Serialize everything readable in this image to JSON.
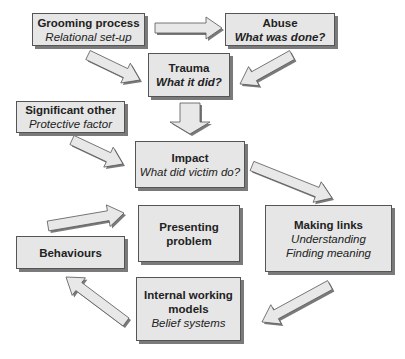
{
  "diagram": {
    "nodes": [
      {
        "id": "grooming",
        "title": "Grooming process",
        "subtitle": "Relational set-up"
      },
      {
        "id": "abuse",
        "title": "Abuse",
        "subtitle": "What was done?"
      },
      {
        "id": "trauma",
        "title": "Trauma",
        "subtitle": "What it did?"
      },
      {
        "id": "significant_other",
        "title": "Significant other",
        "subtitle": "Protective factor"
      },
      {
        "id": "impact",
        "title": "Impact",
        "subtitle": "What did victim do?"
      },
      {
        "id": "presenting",
        "title_line1": "Presenting",
        "title_line2": "problem"
      },
      {
        "id": "making_links",
        "title": "Making links",
        "subtitle_line1": "Understanding",
        "subtitle_line2": "Finding meaning"
      },
      {
        "id": "behaviours",
        "title": "Behaviours"
      },
      {
        "id": "iwm",
        "title_line1": "Internal working",
        "title_line2": "models",
        "subtitle": "Belief systems"
      }
    ],
    "edges": [
      {
        "from": "grooming",
        "to": "abuse"
      },
      {
        "from": "grooming",
        "to": "trauma"
      },
      {
        "from": "abuse",
        "to": "trauma"
      },
      {
        "from": "trauma",
        "to": "impact"
      },
      {
        "from": "significant_other",
        "to": "impact"
      },
      {
        "from": "impact",
        "to": "making_links"
      },
      {
        "from": "making_links",
        "to": "iwm"
      },
      {
        "from": "iwm",
        "to": "behaviours"
      },
      {
        "from": "behaviours",
        "to": "presenting"
      }
    ],
    "colors": {
      "box_fill": "#e6e6e6",
      "box_border": "#555555",
      "shadow": "#7a7a7a",
      "arrow_fill": "#e8e8e8",
      "arrow_stroke": "#555555"
    }
  }
}
